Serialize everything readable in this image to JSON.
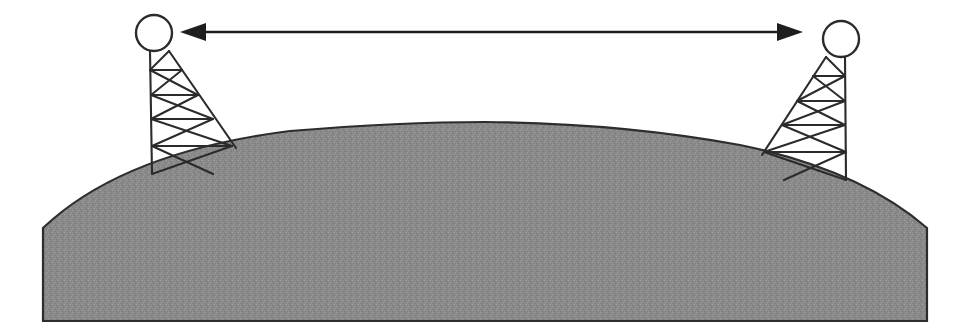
{
  "canvas": {
    "width": 963,
    "height": 336,
    "background_color": "#ffffff"
  },
  "figure": {
    "kind": "line-of-sight-radio-link-diagram",
    "label_text": ""
  },
  "colors": {
    "ground_fill": "#8a8a8a",
    "ground_outline": "#2d2d2d",
    "line_color": "#2b2b2b",
    "arrow_color": "#1e1e1e",
    "antenna_fill": "#ffffff",
    "background": "#ffffff"
  },
  "ground": {
    "name": "curved-earth-surface",
    "left_x": 43,
    "right_x": 927,
    "bottom_y": 321,
    "shoulder_y": 228,
    "apex_x": 485,
    "apex_y": 122,
    "texture": "noise-speckle"
  },
  "arrow": {
    "name": "distance-arrow",
    "style": "double-headed",
    "y": 32,
    "left_tip_x": 180,
    "right_tip_x": 803,
    "head_length": 26,
    "head_half_width": 9,
    "label": ""
  },
  "towers": [
    {
      "id": "left-tower",
      "side": "left",
      "antenna": {
        "name": "antenna-dish-left",
        "cx": 154,
        "cy": 33,
        "r": 18
      },
      "mast": {
        "top_left_x": 150,
        "top_right_x": 169,
        "top_y": 51,
        "base_left_x": 152,
        "base_left_y": 174,
        "base_right_x": 236,
        "base_right_y": 148
      },
      "rung_count": 5,
      "brace_style": "zigzag-diagonal"
    },
    {
      "id": "right-tower",
      "side": "right",
      "antenna": {
        "name": "antenna-dish-right",
        "cx": 841,
        "cy": 39,
        "r": 18
      },
      "mast": {
        "top_left_x": 826,
        "top_right_x": 845,
        "top_y": 57,
        "base_left_x": 762,
        "base_left_y": 155,
        "base_right_x": 846,
        "base_right_y": 180
      },
      "rung_count": 5,
      "brace_style": "zigzag-diagonal"
    }
  ]
}
